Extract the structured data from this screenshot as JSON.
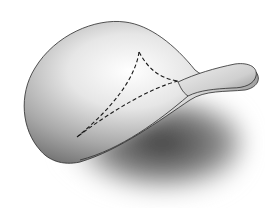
{
  "diagram": {
    "colors": {
      "background": "#ffffff",
      "surface_light": "#f4f4f4",
      "surface_mid": "#b8b8b8",
      "surface_dark": "#5a5a5a",
      "outline": "#2a2a2a",
      "dashed_triangle": "#1a1a1a"
    },
    "triangle": {
      "vertices": [
        {
          "label": "",
          "x": 139,
          "y": 52
        },
        {
          "label": "",
          "x": 178,
          "y": 81
        },
        {
          "label": "",
          "x": 77,
          "y": 137
        }
      ],
      "style": "dashed"
    }
  }
}
